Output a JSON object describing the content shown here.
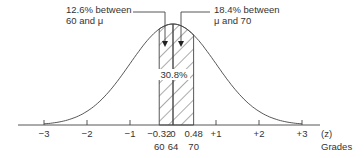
{
  "chart_data": {
    "type": "area",
    "title": "",
    "distribution": "normal",
    "mean_grade": 64,
    "x_axis": {
      "label": "(z)",
      "secondary_label": "Grades",
      "range": [
        -3.4,
        3.4
      ],
      "z_ticks": [
        {
          "z": -3,
          "label": "−3"
        },
        {
          "z": -2,
          "label": "−2"
        },
        {
          "z": -1,
          "label": "−1"
        },
        {
          "z": -0.32,
          "label": "−0.32"
        },
        {
          "z": 0,
          "label": "0"
        },
        {
          "z": 0.48,
          "label": "0.48"
        },
        {
          "z": 1,
          "label": "+1"
        },
        {
          "z": 2,
          "label": "+2"
        },
        {
          "z": 3,
          "label": "+3"
        }
      ],
      "grade_ticks": [
        {
          "z": -0.32,
          "label": "60"
        },
        {
          "z": 0,
          "label": "64"
        },
        {
          "z": 0.48,
          "label": "70"
        }
      ]
    },
    "shaded_regions": [
      {
        "from_z": -0.32,
        "to_z": 0,
        "percent": 12.6
      },
      {
        "from_z": 0,
        "to_z": 0.48,
        "percent": 18.4
      }
    ],
    "annotations": {
      "left": [
        "12.6% between",
        "60 and μ"
      ],
      "right": [
        "18.4% between",
        "μ and 70"
      ],
      "total": "30.8%"
    }
  }
}
